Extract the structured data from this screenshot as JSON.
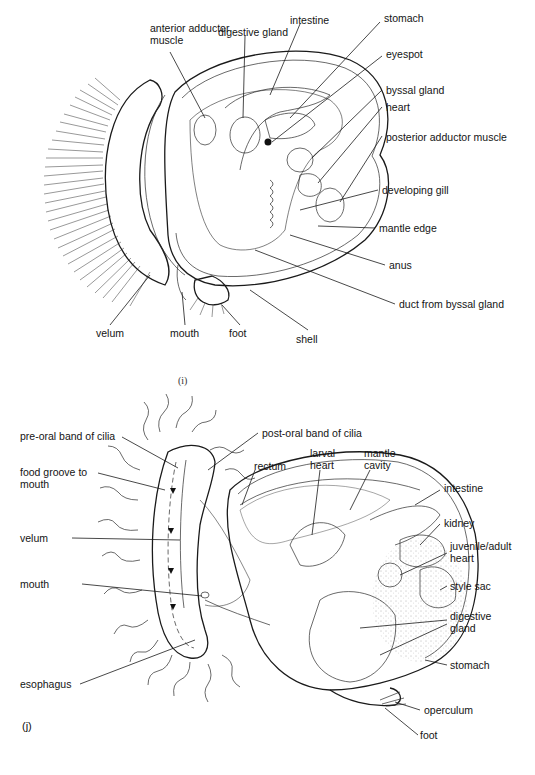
{
  "figure": {
    "panels": [
      {
        "id": "i",
        "caption": "(i)",
        "subject": "pediveliger bivalve larva",
        "labels": [
          {
            "key": "anterior_adductor_muscle",
            "text": "anterior adductor muscle"
          },
          {
            "key": "digestive_gland",
            "text": "digestive gland"
          },
          {
            "key": "intestine",
            "text": "intestine"
          },
          {
            "key": "stomach",
            "text": "stomach"
          },
          {
            "key": "eyespot",
            "text": "eyespot"
          },
          {
            "key": "byssal_gland",
            "text": "byssal gland"
          },
          {
            "key": "heart",
            "text": "heart"
          },
          {
            "key": "posterior_adductor_muscle",
            "text": "posterior adductor muscle"
          },
          {
            "key": "developing_gill",
            "text": "developing gill"
          },
          {
            "key": "mantle_edge",
            "text": "mantle edge"
          },
          {
            "key": "anus",
            "text": "anus"
          },
          {
            "key": "duct_from_byssal_gland",
            "text": "duct from byssal gland"
          },
          {
            "key": "velum",
            "text": "velum"
          },
          {
            "key": "mouth",
            "text": "mouth"
          },
          {
            "key": "foot",
            "text": "foot"
          },
          {
            "key": "shell",
            "text": "shell"
          }
        ]
      },
      {
        "id": "j",
        "caption": "(j)",
        "subject": "gastropod veliger larva",
        "labels": [
          {
            "key": "pre_oral_band_of_cilia",
            "text": "pre-oral band of cilia"
          },
          {
            "key": "post_oral_band_of_cilia",
            "text": "post-oral band of cilia"
          },
          {
            "key": "food_groove_to_mouth",
            "text": "food groove to mouth"
          },
          {
            "key": "rectum",
            "text": "rectum"
          },
          {
            "key": "larval_heart",
            "text": "larval heart"
          },
          {
            "key": "mantle_cavity",
            "text": "mantle cavity"
          },
          {
            "key": "intestine",
            "text": "intestine"
          },
          {
            "key": "kidney",
            "text": "kidney"
          },
          {
            "key": "velum",
            "text": "velum"
          },
          {
            "key": "juvenile_adult_heart",
            "text": "juvenile/adult heart"
          },
          {
            "key": "mouth",
            "text": "mouth"
          },
          {
            "key": "style_sac",
            "text": "style sac"
          },
          {
            "key": "digestive_gland",
            "text": "digestive gland"
          },
          {
            "key": "stomach",
            "text": "stomach"
          },
          {
            "key": "esophagus",
            "text": "esophagus"
          },
          {
            "key": "operculum",
            "text": "operculum"
          },
          {
            "key": "foot",
            "text": "foot"
          }
        ]
      }
    ]
  },
  "i": {
    "caption": "(i)",
    "anterior_adductor_muscle": "anterior adductor muscle",
    "digestive_gland": "digestive gland",
    "intestine": "intestine",
    "stomach": "stomach",
    "eyespot": "eyespot",
    "byssal_gland": "byssal gland",
    "heart": "heart",
    "posterior_adductor_muscle": "posterior adductor muscle",
    "developing_gill": "developing gill",
    "mantle_edge": "mantle edge",
    "anus": "anus",
    "duct_from_byssal_gland": "duct from byssal gland",
    "velum": "velum",
    "mouth": "mouth",
    "foot": "foot",
    "shell": "shell"
  },
  "j": {
    "caption": "(j)",
    "pre_oral_band_of_cilia": "pre-oral band of cilia",
    "post_oral_band_of_cilia": "post-oral band of cilia",
    "food_groove_to_mouth": "food groove to mouth",
    "rectum": "rectum",
    "larval_heart": "larval heart",
    "mantle_cavity": "mantle cavity",
    "intestine": "intestine",
    "kidney": "kidney",
    "velum": "velum",
    "juvenile_adult_heart": "juvenile/adult heart",
    "mouth": "mouth",
    "style_sac": "style sac",
    "digestive_gland": "digestive gland",
    "stomach": "stomach",
    "esophagus": "esophagus",
    "operculum": "operculum",
    "foot": "foot"
  }
}
